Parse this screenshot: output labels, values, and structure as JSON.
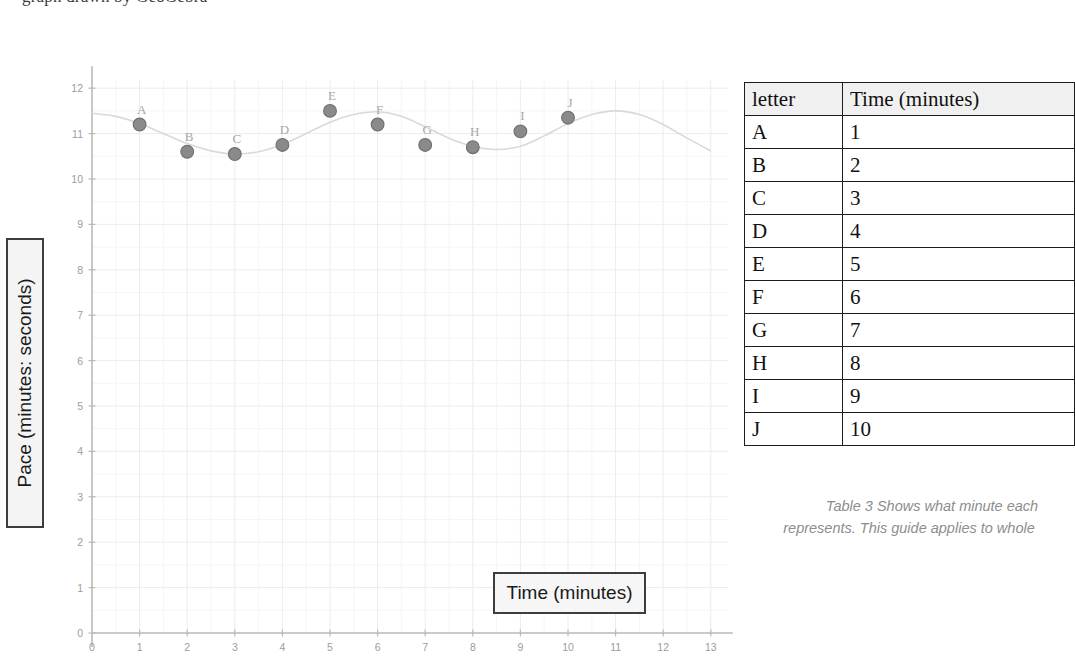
{
  "top_note": "graph drawn by GeoGebra",
  "chart_panel": {
    "y_axis_label": "Pace (minutes: seconds)",
    "x_axis_label": "Time (minutes)"
  },
  "table": {
    "headers": [
      "letter",
      "Time (minutes)"
    ],
    "rows": [
      [
        "A",
        "1"
      ],
      [
        "B",
        "2"
      ],
      [
        "C",
        "3"
      ],
      [
        "D",
        "4"
      ],
      [
        "E",
        "5"
      ],
      [
        "F",
        "6"
      ],
      [
        "G",
        "7"
      ],
      [
        "H",
        "8"
      ],
      [
        "I",
        "9"
      ],
      [
        "J",
        "10"
      ]
    ],
    "caption_line1": "Table 3 Shows what minute each",
    "caption_line2": "represents. This guide applies to whole"
  },
  "colors": {
    "point_fill": "#8a8a8a",
    "point_stroke": "#6f6f6f",
    "curve": "#d9d9d9",
    "axis": "#b9b9b9",
    "grid_major": "#ececec",
    "grid_minor": "#f5f5f5",
    "tick_text": "#9c9c9c",
    "point_label": "#a8a8a8",
    "box_border": "#3d3d3d"
  },
  "chart_data": {
    "type": "scatter",
    "title": "",
    "xlabel": "Time (minutes)",
    "ylabel": "Pace (minutes: seconds)",
    "xlim": [
      0,
      13
    ],
    "ylim": [
      0,
      12
    ],
    "xticks": [
      0,
      1,
      2,
      3,
      4,
      5,
      6,
      7,
      8,
      9,
      10,
      11,
      12,
      13
    ],
    "yticks": [
      0,
      1,
      2,
      3,
      4,
      5,
      6,
      7,
      8,
      9,
      10,
      11,
      12
    ],
    "grid": true,
    "legend": "none",
    "point_labels": [
      "A",
      "B",
      "C",
      "D",
      "E",
      "F",
      "G",
      "H",
      "I",
      "J"
    ],
    "x": [
      1,
      2,
      3,
      4,
      5,
      6,
      7,
      8,
      9,
      10
    ],
    "y": [
      11.2,
      10.6,
      10.55,
      10.75,
      11.5,
      11.2,
      10.75,
      10.7,
      11.05,
      11.35
    ],
    "fit_curve": {
      "description": "smooth sinusoidal best-fit curve through the plotted points, extending from x=0 to x=13",
      "x": [
        0,
        0.5,
        1,
        1.5,
        2,
        2.5,
        3,
        3.5,
        4,
        4.5,
        5,
        5.5,
        6,
        6.5,
        7,
        7.5,
        8,
        8.5,
        9,
        9.5,
        10,
        10.5,
        11,
        11.5,
        12,
        12.5,
        13
      ],
      "y": [
        11.45,
        11.38,
        11.22,
        11.0,
        10.78,
        10.62,
        10.55,
        10.6,
        10.76,
        11.0,
        11.25,
        11.42,
        11.48,
        11.38,
        11.15,
        10.9,
        10.72,
        10.65,
        10.72,
        10.95,
        11.22,
        11.42,
        11.5,
        11.42,
        11.2,
        10.9,
        10.62
      ]
    }
  }
}
